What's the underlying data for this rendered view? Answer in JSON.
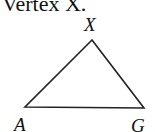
{
  "heading": {
    "text": "Vertex X."
  },
  "triangle": {
    "vertices": [
      {
        "label": "X",
        "x": 92,
        "y": 40
      },
      {
        "label": "A",
        "x": 25,
        "y": 107
      },
      {
        "label": "G",
        "x": 144,
        "y": 108
      }
    ],
    "stroke_color": "#222222"
  }
}
